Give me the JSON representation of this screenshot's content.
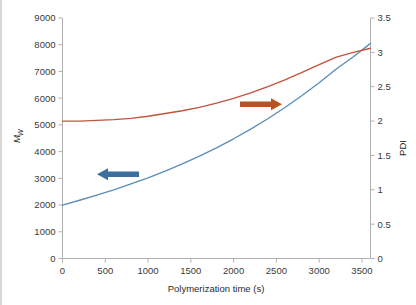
{
  "chart_data": {
    "type": "line",
    "title": "",
    "subtitle": "",
    "xlabel": "Polymerization time (s)",
    "ylabel": "Mw",
    "ylabel_right": "PDI",
    "xlim": [
      0,
      3600
    ],
    "ylim": [
      0,
      9000
    ],
    "ylim_right": [
      0,
      3.5
    ],
    "grid": false,
    "legend_position": "none",
    "x_ticks": [
      0,
      500,
      1000,
      1500,
      2000,
      2500,
      3000,
      3500
    ],
    "x_tick_labels": [
      "0",
      "500",
      "1000",
      "1500",
      "2000",
      "2500",
      "3000",
      "3500"
    ],
    "y_ticks": [
      0,
      1000,
      2000,
      3000,
      4000,
      5000,
      6000,
      7000,
      8000,
      9000
    ],
    "y_tick_labels": [
      "0",
      "1000",
      "2000",
      "3000",
      "4000",
      "5000",
      "6000",
      "7000",
      "8000",
      "9000"
    ],
    "y_right_ticks": [
      0,
      0.5,
      1,
      1.5,
      2,
      2.5,
      3,
      3.5
    ],
    "y_right_tick_labels": [
      "0",
      "0.5",
      "1",
      "1.5",
      "2",
      "2.5",
      "3",
      "3.5"
    ],
    "series": [
      {
        "name": "Mw",
        "axis": "left",
        "color": "#5b8db8",
        "x": [
          0,
          200,
          400,
          600,
          800,
          1000,
          1200,
          1400,
          1600,
          1800,
          2000,
          2200,
          2400,
          2600,
          2800,
          3000,
          3200,
          3400,
          3600
        ],
        "values": [
          2000,
          2180,
          2370,
          2570,
          2790,
          3020,
          3270,
          3540,
          3830,
          4140,
          4480,
          4840,
          5230,
          5650,
          6100,
          6580,
          7090,
          7550,
          8050
        ]
      },
      {
        "name": "PDI",
        "axis": "right",
        "color": "#c0543c",
        "x": [
          0,
          200,
          400,
          600,
          800,
          1000,
          1200,
          1400,
          1600,
          1800,
          2000,
          2200,
          2400,
          2600,
          2800,
          3000,
          3200,
          3400,
          3600
        ],
        "values": [
          2.0,
          2.0,
          2.01,
          2.02,
          2.04,
          2.07,
          2.11,
          2.15,
          2.2,
          2.26,
          2.33,
          2.41,
          2.5,
          2.6,
          2.71,
          2.82,
          2.93,
          3.0,
          3.06
        ]
      }
    ],
    "annotations": [
      {
        "name": "mw-axis-arrow",
        "direction": "left",
        "color": "#3d6f9e",
        "points_to": "left-axis",
        "x_start": 3600,
        "x_end": 3600,
        "label": ""
      },
      {
        "name": "pdi-axis-arrow",
        "direction": "right",
        "color": "#b8531f",
        "points_to": "right-axis",
        "label": ""
      }
    ]
  },
  "axes": {
    "x_title": "Polymerization time (s)",
    "y_left_title": "M",
    "y_left_subscript": "w",
    "y_right_title": "PDI"
  },
  "colors": {
    "mw_line": "#5b8db8",
    "pdi_line": "#c0543c",
    "mw_arrow": "#3d6f9e",
    "pdi_arrow": "#b8531f",
    "axis": "#b0b0b0",
    "text": "#3a3a3a",
    "background": "#ffffff"
  }
}
